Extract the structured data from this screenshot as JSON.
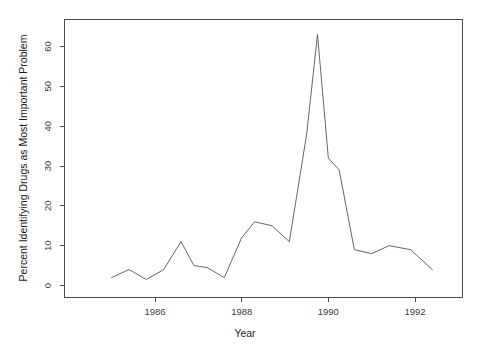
{
  "chart_data": {
    "type": "line",
    "title": "",
    "xlabel": "Year",
    "ylabel": "Percent Identifying Drugs as Most Important Problem",
    "xlim": [
      1985.0,
      1992.6
    ],
    "ylim": [
      0,
      65
    ],
    "xticks": [
      1986,
      1988,
      1990,
      1992
    ],
    "xticklabels": [
      "1986",
      "1988",
      "1990",
      "1992"
    ],
    "yticks": [
      0,
      10,
      20,
      30,
      40,
      50,
      60
    ],
    "yticklabels": [
      "0",
      "10",
      "20",
      "30",
      "40",
      "50",
      "60"
    ],
    "grid": false,
    "legend": false,
    "series": [
      {
        "name": "Percent Identifying Drugs as Most Important Problem",
        "color": "#555555",
        "x": [
          1985.0,
          1985.4,
          1985.8,
          1986.2,
          1986.6,
          1986.9,
          1987.2,
          1987.6,
          1988.0,
          1988.3,
          1988.7,
          1989.1,
          1989.5,
          1989.75,
          1990.0,
          1990.25,
          1990.6,
          1991.0,
          1991.4,
          1991.9,
          1992.4
        ],
        "y": [
          2.0,
          4.0,
          1.5,
          4.0,
          11.0,
          5.0,
          4.5,
          2.0,
          12.0,
          16.0,
          15.0,
          11.0,
          38.0,
          63.0,
          32.0,
          29.0,
          9.0,
          8.0,
          10.0,
          9.0,
          4.0
        ]
      }
    ]
  },
  "axes": {
    "x_title": "Year",
    "y_title": "Percent Identifying Drugs as Most Important Problem"
  }
}
